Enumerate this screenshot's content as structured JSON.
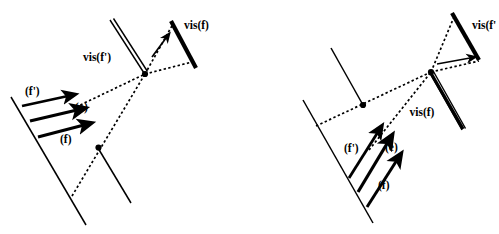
{
  "figure": {
    "title": "",
    "background_color": "#ffffff",
    "stroke_color": "#000000",
    "panels": [
      {
        "id": "left-panel",
        "name": "left-configuration",
        "labels": {
          "vis_f_prime": "vis(f')",
          "vis_f": "vis(f)",
          "face_f_prime": "(f')",
          "edge_e": "(e)",
          "face_f": "(f)"
        },
        "elements": {
          "double_line": "vis(f')",
          "thick_bar": "vis(f)",
          "arrow_count": 3,
          "dot_count": 2,
          "dotted_arrow_direction": "up-right"
        }
      },
      {
        "id": "right-panel",
        "name": "right-configuration",
        "labels": {
          "vis_f_prime": "vis(f'",
          "vis_f": "vis(f)",
          "face_f_prime": "(f')",
          "edge_e": "(e)",
          "face_f": "(f)"
        },
        "elements": {
          "double_line": "vis(f)",
          "thick_bar": "vis(f')",
          "arrow_count": 3,
          "dot_count": 2,
          "dotted_arrow_direction": "right"
        }
      }
    ]
  }
}
